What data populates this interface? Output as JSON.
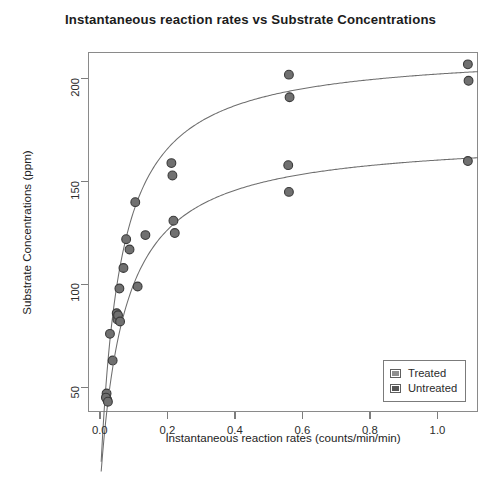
{
  "chart_data": {
    "type": "scatter",
    "title": "Instantaneous reaction rates vs Substrate Concentrations",
    "xlabel": "Instantaneous reaction rates (counts/min/min)",
    "ylabel": "Substrate Concentrations (ppm)",
    "xlim": [
      -0.035,
      1.12
    ],
    "ylim": [
      38,
      213
    ],
    "xticks": [
      0.0,
      0.2,
      0.4,
      0.6,
      0.8,
      1.0
    ],
    "xtick_labels": [
      "0.0",
      "0.2",
      "0.4",
      "0.6",
      "0.8",
      "1.0"
    ],
    "yticks": [
      50,
      100,
      150,
      200
    ],
    "ytick_labels": [
      "50",
      "100",
      "150",
      "200"
    ],
    "grid": false,
    "legend_position": "bottom-right",
    "marker_fill": "#707070",
    "marker_edge": "#3a3a3a",
    "curve_color": "#6e6e6e",
    "frame_color": "#8a8a8a",
    "series": [
      {
        "name": "Treated",
        "swatch_color": "#8e8e8e",
        "points": [
          {
            "x": 0.02,
            "y": 47
          },
          {
            "x": 0.022,
            "y": 44
          },
          {
            "x": 0.03,
            "y": 76
          },
          {
            "x": 0.038,
            "y": 63
          },
          {
            "x": 0.05,
            "y": 86
          },
          {
            "x": 0.052,
            "y": 83
          },
          {
            "x": 0.058,
            "y": 98
          },
          {
            "x": 0.07,
            "y": 108
          },
          {
            "x": 0.105,
            "y": 140
          },
          {
            "x": 0.212,
            "y": 159
          },
          {
            "x": 0.215,
            "y": 153
          },
          {
            "x": 0.56,
            "y": 202
          },
          {
            "x": 0.562,
            "y": 191
          },
          {
            "x": 1.09,
            "y": 207
          },
          {
            "x": 1.092,
            "y": 199
          }
        ],
        "curve": {
          "model": "michaelis-menten",
          "vmax": 214,
          "km": 0.058,
          "offset": 0
        }
      },
      {
        "name": "Untreated",
        "swatch_color": "#555555",
        "points": [
          {
            "x": 0.018,
            "y": 45
          },
          {
            "x": 0.024,
            "y": 43
          },
          {
            "x": 0.054,
            "y": 85
          },
          {
            "x": 0.06,
            "y": 82
          },
          {
            "x": 0.078,
            "y": 122
          },
          {
            "x": 0.088,
            "y": 117
          },
          {
            "x": 0.112,
            "y": 99
          },
          {
            "x": 0.135,
            "y": 124
          },
          {
            "x": 0.218,
            "y": 131
          },
          {
            "x": 0.222,
            "y": 125
          },
          {
            "x": 0.558,
            "y": 158
          },
          {
            "x": 0.56,
            "y": 145
          },
          {
            "x": 1.09,
            "y": 160
          }
        ],
        "curve": {
          "model": "michaelis-menten",
          "vmax": 172,
          "km": 0.072,
          "offset": 0
        }
      }
    ]
  },
  "legend": {
    "items": [
      {
        "label": "Treated"
      },
      {
        "label": "Untreated"
      }
    ]
  }
}
